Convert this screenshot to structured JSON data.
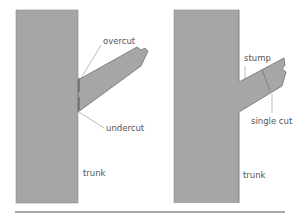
{
  "diagrams": [
    {
      "id": "left",
      "title": "two-cut method",
      "labels": {
        "overcut": "overcut",
        "undercut": "undercut",
        "trunk": "trunk"
      }
    },
    {
      "id": "right",
      "title": "single-cut method",
      "labels": {
        "stump": "stump",
        "single_cut": "single cut",
        "trunk": "trunk"
      }
    }
  ],
  "colors": {
    "wood": "#a6a6a6",
    "outline": "#6e6e6e",
    "leader": "#8a8a8a",
    "text": "#555555",
    "rule": "#555555"
  }
}
